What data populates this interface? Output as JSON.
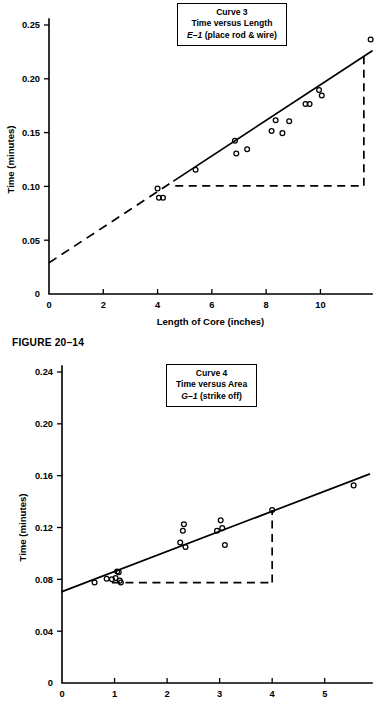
{
  "figure": {
    "caption": "FIGURE 20–14"
  },
  "charts": [
    {
      "id": "chart1",
      "title_lines": [
        "Curve 3",
        "Time versus Length",
        "E–1 (place rod & wire)"
      ],
      "title_code": "E–1",
      "title_code_rest": " (place rod & wire)",
      "xlabel": "Length of Core (inches)",
      "ylabel": "Time (minutes)",
      "xticks": [
        "0",
        "2",
        "4",
        "6",
        "8",
        "10"
      ],
      "yticks": [
        "0",
        "0.05",
        "0.10",
        "0.15",
        "0.20",
        "0.25"
      ]
    },
    {
      "id": "chart2",
      "title_lines": [
        "Curve 4",
        "Time versus Area",
        "G–1 (strike off)"
      ],
      "title_code": "G–1",
      "title_code_rest": " (strike off)",
      "xlabel": "",
      "ylabel": "Time (minutes)",
      "xticks": [
        "0",
        "1",
        "2",
        "3",
        "4",
        "5"
      ],
      "yticks": [
        "0",
        "0.04",
        "0.08",
        "0.12",
        "0.16",
        "0.20",
        "0.24"
      ]
    }
  ],
  "chart_data": [
    {
      "type": "scatter",
      "title": "Curve 3 — Time versus Length — E-1 (place rod & wire)",
      "xlabel": "Length of Core (inches)",
      "ylabel": "Time (minutes)",
      "xlim": [
        0,
        11.9
      ],
      "ylim": [
        0,
        0.25
      ],
      "xticks": [
        0,
        2,
        4,
        6,
        8,
        10
      ],
      "yticks": [
        0,
        0.05,
        0.1,
        0.15,
        0.2,
        0.25
      ],
      "grid": false,
      "legend": "none",
      "series": [
        {
          "name": "observations",
          "marker": "open-circle",
          "points": [
            [
              4.0,
              0.098
            ],
            [
              4.05,
              0.0895
            ],
            [
              4.2,
              0.0895
            ],
            [
              5.4,
              0.1155
            ],
            [
              6.85,
              0.1425
            ],
            [
              6.9,
              0.1305
            ],
            [
              7.3,
              0.1345
            ],
            [
              8.2,
              0.1515
            ],
            [
              8.35,
              0.1615
            ],
            [
              8.6,
              0.1495
            ],
            [
              8.85,
              0.1605
            ],
            [
              9.45,
              0.1765
            ],
            [
              9.6,
              0.1765
            ],
            [
              9.95,
              0.1895
            ],
            [
              10.05,
              0.1845
            ],
            [
              11.85,
              0.2365
            ]
          ]
        }
      ],
      "fit_line": {
        "name": "fitted straight line",
        "style": "solid with dashed extrapolation below x=4.6",
        "intercept": 0.029,
        "slope": 0.01655,
        "solid_from": [
          4.6,
          0.1051
        ],
        "solid_to": [
          11.9,
          0.2259
        ],
        "dashed_from": [
          0.0,
          0.029
        ],
        "dashed_to": [
          4.6,
          0.1051
        ]
      },
      "slope_guide": {
        "description": "dashed right triangle used to read the slope",
        "horizontal_y": 0.1005,
        "horizontal_from_x": 4.65,
        "horizontal_to_x": 11.6,
        "vertical_x": 11.6,
        "vertical_from_y": 0.1005,
        "vertical_to_y": 0.2213
      }
    },
    {
      "type": "scatter",
      "title": "Curve 4 — Time versus Area — G-1 (strike off)",
      "xlabel": "",
      "ylabel": "Time (minutes)",
      "xlim": [
        0,
        5.9
      ],
      "ylim": [
        0,
        0.24
      ],
      "xticks": [
        0,
        1,
        2,
        3,
        4,
        5
      ],
      "yticks": [
        0,
        0.04,
        0.08,
        0.12,
        0.16,
        0.2,
        0.24
      ],
      "grid": false,
      "legend": "none",
      "series": [
        {
          "name": "observations",
          "marker": "open-circle",
          "points": [
            [
              0.62,
              0.0775
            ],
            [
              0.85,
              0.0805
            ],
            [
              0.95,
              0.08
            ],
            [
              1.02,
              0.081
            ],
            [
              1.05,
              0.086
            ],
            [
              1.08,
              0.0855
            ],
            [
              1.1,
              0.079
            ],
            [
              1.12,
              0.0775
            ],
            [
              2.25,
              0.1085
            ],
            [
              2.3,
              0.1175
            ],
            [
              2.32,
              0.1225
            ],
            [
              2.35,
              0.105
            ],
            [
              2.95,
              0.1175
            ],
            [
              3.02,
              0.1255
            ],
            [
              3.05,
              0.1195
            ],
            [
              3.1,
              0.1065
            ],
            [
              4.0,
              0.1335
            ],
            [
              5.55,
              0.1525
            ]
          ]
        }
      ],
      "fit_line": {
        "name": "fitted straight line",
        "style": "solid",
        "intercept": 0.0705,
        "slope": 0.0155,
        "solid_from": [
          0.0,
          0.0705
        ],
        "solid_to": [
          5.85,
          0.1612
        ]
      },
      "slope_guide": {
        "description": "dashed right triangle used to read the slope",
        "horizontal_y": 0.0775,
        "horizontal_from_x": 0.95,
        "horizontal_to_x": 4.0,
        "vertical_x": 4.0,
        "vertical_from_y": 0.0775,
        "vertical_to_y": 0.1335
      }
    }
  ]
}
